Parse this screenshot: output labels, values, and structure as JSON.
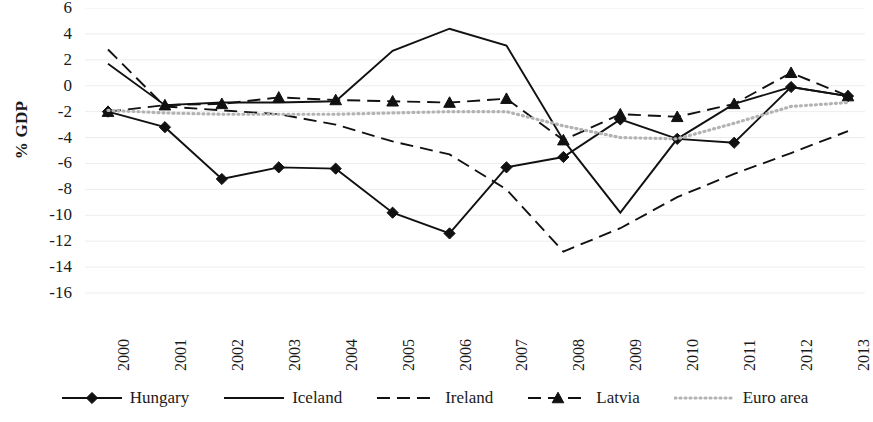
{
  "chart_data": {
    "type": "line",
    "title": "",
    "xlabel": "",
    "ylabel": "% GDP",
    "ylim": [
      -16,
      6
    ],
    "ytick_step": 2,
    "grid": true,
    "grid_orientation": "horizontal",
    "legend_position": "bottom",
    "categories": [
      "2000",
      "2001",
      "2002",
      "2003",
      "2004",
      "2005",
      "2006",
      "2007",
      "2008",
      "2009",
      "2010",
      "2011",
      "2012",
      "2013"
    ],
    "yticks": [
      "6",
      "4",
      "2",
      "0",
      "-2",
      "-4",
      "-6",
      "-8",
      "-10",
      "-12",
      "-14",
      "-16"
    ],
    "series": [
      {
        "name": "Hungary",
        "style": "solid",
        "marker": "diamond",
        "color": "#111111",
        "values": [
          -2.0,
          -3.2,
          -7.2,
          -6.3,
          -6.4,
          -9.8,
          -11.4,
          -6.3,
          -5.5,
          -2.6,
          -4.1,
          -4.4,
          -0.1,
          -0.8
        ]
      },
      {
        "name": "Iceland",
        "style": "solid",
        "marker": "none",
        "color": "#111111",
        "values": [
          1.7,
          -1.5,
          -1.3,
          -1.3,
          -1.2,
          2.7,
          4.4,
          3.1,
          -4.2,
          -9.8,
          -4.1,
          -1.4,
          -0.1,
          -0.8
        ]
      },
      {
        "name": "Ireland",
        "style": "dashed",
        "marker": "none",
        "color": "#111111",
        "values": [
          2.8,
          -1.6,
          -1.9,
          -2.2,
          -3.0,
          -4.3,
          -5.3,
          -8.0,
          -12.8,
          -11.0,
          -8.6,
          -6.8,
          -5.2,
          -3.5
        ]
      },
      {
        "name": "Latvia",
        "style": "dashed",
        "marker": "triangle",
        "color": "#111111",
        "values": [
          -2.0,
          -1.5,
          -1.4,
          -0.9,
          -1.1,
          -1.2,
          -1.3,
          -1.0,
          -4.2,
          -2.2,
          -2.4,
          -1.4,
          1.0,
          -0.8
        ]
      },
      {
        "name": "Euro area",
        "style": "dotted",
        "marker": "none",
        "color": "#b3b3b3",
        "values": [
          -1.9,
          -2.1,
          -2.2,
          -2.2,
          -2.2,
          -2.1,
          -2.0,
          -2.0,
          -3.1,
          -4.0,
          -4.1,
          -2.9,
          -1.6,
          -1.3
        ]
      }
    ]
  },
  "legend": {
    "items": [
      {
        "label": "Hungary"
      },
      {
        "label": "Iceland"
      },
      {
        "label": "Ireland"
      },
      {
        "label": "Latvia"
      },
      {
        "label": "Euro area"
      }
    ]
  }
}
